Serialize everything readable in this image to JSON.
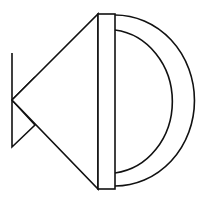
{
  "figure": {
    "stroke_color": "#111111",
    "background_color": "#ffffff",
    "stroke_width": 1.6,
    "parts": {
      "tail_triangle": {
        "points": "12,53 12,147 35,125 12,100 35,77"
      },
      "cone": {
        "points": "12,100 98,14 98,189"
      },
      "band": {
        "x": 98,
        "y": 14,
        "width": 17,
        "height": 175
      },
      "outer_arc": {
        "d": "M115,15 A79,85 0 0 1 115,186"
      },
      "inner_arc": {
        "d": "M115,30 A65,72 0 0 1 115,173"
      }
    }
  }
}
